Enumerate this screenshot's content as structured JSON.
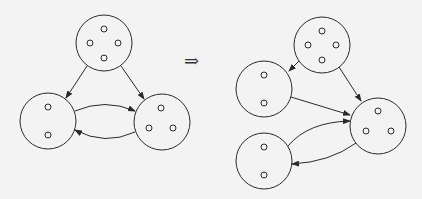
{
  "figure": {
    "transition_symbol": "⇒",
    "stroke_color": "#2a2a2a",
    "background_color": "#f3f3f3",
    "left_graph": {
      "nodes": [
        {
          "id": "A",
          "cx": 104,
          "cy": 43,
          "r": 28,
          "members": 4
        },
        {
          "id": "B",
          "cx": 48,
          "cy": 121,
          "r": 28,
          "members": 2
        },
        {
          "id": "C",
          "cx": 162,
          "cy": 122,
          "r": 28,
          "members": 3
        }
      ],
      "edges": [
        {
          "from": "A",
          "to": "B"
        },
        {
          "from": "A",
          "to": "C"
        },
        {
          "from": "B",
          "to": "C"
        },
        {
          "from": "C",
          "to": "B"
        }
      ]
    },
    "right_graph": {
      "nodes": [
        {
          "id": "A",
          "cx": 322,
          "cy": 45,
          "r": 28,
          "members": 4
        },
        {
          "id": "B1",
          "cx": 264,
          "cy": 89,
          "r": 28,
          "members": 2
        },
        {
          "id": "B2",
          "cx": 264,
          "cy": 161,
          "r": 28,
          "members": 2
        },
        {
          "id": "C",
          "cx": 378,
          "cy": 126,
          "r": 28,
          "members": 3
        }
      ],
      "edges": [
        {
          "from": "A",
          "to": "B1"
        },
        {
          "from": "A",
          "to": "C"
        },
        {
          "from": "B1",
          "to": "C"
        },
        {
          "from": "B2",
          "to": "C"
        },
        {
          "from": "C",
          "to": "B2"
        }
      ]
    }
  }
}
